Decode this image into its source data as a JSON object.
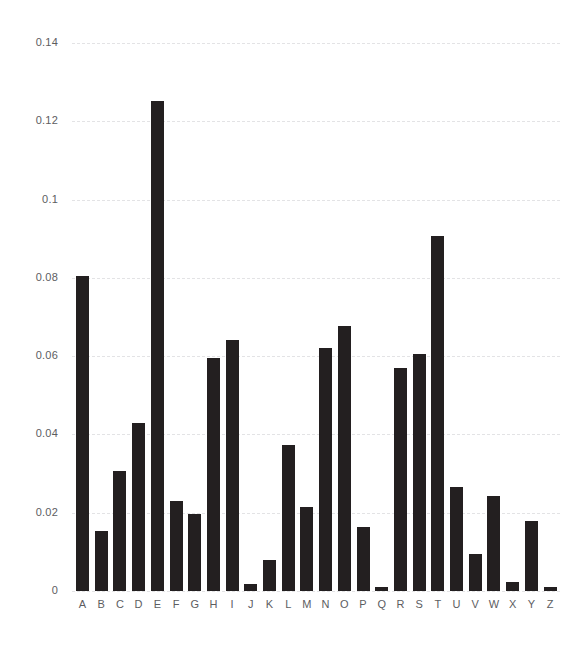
{
  "chart_data": {
    "type": "bar",
    "title": "",
    "subtitle": "",
    "xlabel": "",
    "ylabel": "",
    "categories": [
      "A",
      "B",
      "C",
      "D",
      "E",
      "F",
      "G",
      "H",
      "I",
      "J",
      "K",
      "L",
      "M",
      "N",
      "O",
      "P",
      "Q",
      "R",
      "S",
      "T",
      "U",
      "V",
      "W",
      "X",
      "Y",
      "Z"
    ],
    "values": [
      0.0804,
      0.0154,
      0.0306,
      0.0429,
      0.1253,
      0.023,
      0.0196,
      0.0595,
      0.0642,
      0.0018,
      0.008,
      0.0372,
      0.0215,
      0.062,
      0.0676,
      0.0164,
      0.001,
      0.057,
      0.0605,
      0.0908,
      0.0265,
      0.0095,
      0.0242,
      0.0022,
      0.0178,
      0.0009
    ],
    "series": [
      {
        "name": "frequency",
        "values": [
          0.0804,
          0.0154,
          0.0306,
          0.0429,
          0.1253,
          0.023,
          0.0196,
          0.0595,
          0.0642,
          0.0018,
          0.008,
          0.0372,
          0.0215,
          0.062,
          0.0676,
          0.0164,
          0.001,
          0.057,
          0.0605,
          0.0908,
          0.0265,
          0.0095,
          0.0242,
          0.0022,
          0.0178,
          0.0009
        ]
      }
    ],
    "ylim": [
      0,
      0.14
    ],
    "xlim_categories": 26,
    "yticks": [
      0,
      0.02,
      0.04,
      0.06,
      0.08,
      0.1,
      0.12,
      0.14
    ],
    "ytick_labels": [
      "0",
      "0.02",
      "0.04",
      "0.06",
      "0.08",
      "0.1",
      "0.12",
      "0.14"
    ],
    "grid": true,
    "grid_axis": "y",
    "grid_style": "dashed",
    "legend": false,
    "legend_position": "none",
    "bar_color": "#231f20",
    "grid_color": "#e3e3e5",
    "background_color": "#ffffff",
    "tick_label_color": "#5d5d5f"
  }
}
